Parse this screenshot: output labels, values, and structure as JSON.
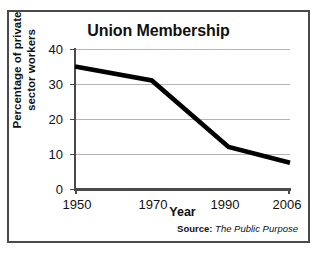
{
  "chart_data": {
    "type": "line",
    "title": "Union Membership",
    "xlabel": "Year",
    "ylabel_line1": "Percentage of private",
    "ylabel_line2": "sector workers",
    "x": [
      1950,
      1970,
      1990,
      2006
    ],
    "xtick_labels": [
      "1950",
      "1970",
      "1990",
      "2006"
    ],
    "values": [
      35,
      31,
      12,
      7.5
    ],
    "ytick_labels": [
      "0",
      "10",
      "20",
      "30",
      "40"
    ],
    "yticks": [
      0,
      10,
      20,
      30,
      40
    ],
    "ylim": [
      0,
      40
    ],
    "xlim": [
      1950,
      2006
    ],
    "grid": true,
    "legend": "none",
    "series_color": "#000000",
    "gridline_color": "#b4b4b4",
    "axis_color": "#4a4a4a",
    "source_label": "Source:",
    "source_value": "The Public Purpose"
  }
}
